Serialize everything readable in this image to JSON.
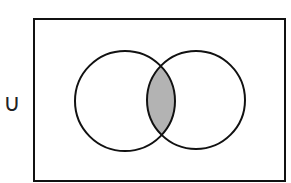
{
  "diagram": {
    "type": "venn",
    "operator_symbol": "∪",
    "universe": {
      "x": 34,
      "y": 19,
      "width": 251,
      "height": 162
    },
    "sets": [
      {
        "name": "A",
        "cx": 125,
        "cy": 101,
        "r": 50
      },
      {
        "name": "B",
        "cx": 196,
        "cy": 100,
        "r": 49
      }
    ],
    "shaded_region": "A ∩ B",
    "colors": {
      "stroke": "#111111",
      "shade": "#b3b3b3",
      "background": "#ffffff"
    }
  }
}
